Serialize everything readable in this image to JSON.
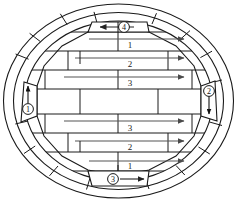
{
  "diagram": {
    "type": "elliptical-kiln-cross-section",
    "shape": "ellipse",
    "wall": {
      "layers": 2,
      "description": "double concentric elliptical ring wall with radial segment joints"
    },
    "canvas": {
      "width": 237,
      "height": 202
    },
    "ports": [
      {
        "id": "port-1",
        "marker": "①",
        "label": "1",
        "position": "left",
        "arrow": "up",
        "arrow_glyph": "↑",
        "x": 28,
        "y": 101
      },
      {
        "id": "port-2",
        "marker": "②",
        "label": "2",
        "position": "right",
        "arrow": "down",
        "arrow_glyph": "↓",
        "x": 209,
        "y": 96
      },
      {
        "id": "port-3",
        "marker": "③",
        "label": "3",
        "position": "bottom",
        "arrow": "right",
        "arrow_glyph": "→",
        "x": 113,
        "y": 182
      },
      {
        "id": "port-4",
        "marker": "④",
        "label": "4",
        "position": "top",
        "arrow": "left",
        "arrow_glyph": "←",
        "x": 124,
        "y": 23
      }
    ],
    "courses": [
      {
        "index": 1,
        "label": "1",
        "y": 46,
        "flow": "right",
        "label_x": 130,
        "arrow_x1": 89,
        "arrow_x2": 186,
        "arrow_y": 39
      },
      {
        "index": 2,
        "label": "2",
        "y": 64,
        "flow": "right",
        "label_x": 130,
        "arrow_x1": 75,
        "arrow_x2": 186,
        "arrow_y": 57
      },
      {
        "index": 3,
        "label": "3",
        "y": 83,
        "flow": "right",
        "label_x": 130,
        "arrow_x1": 64,
        "arrow_x2": 186,
        "arrow_y": 76
      },
      {
        "index": 4,
        "label": "",
        "y": 102,
        "flow": "none",
        "label_x": 130,
        "arrow_x1": 0,
        "arrow_x2": 0,
        "arrow_y": 0
      },
      {
        "index": 5,
        "label": "3",
        "y": 133,
        "flow": "right",
        "label_x": 130,
        "arrow_x1": 64,
        "arrow_x2": 186,
        "arrow_y": 120
      },
      {
        "index": 6,
        "label": "2",
        "y": 153,
        "flow": "right",
        "label_x": 130,
        "arrow_x1": 75,
        "arrow_x2": 186,
        "arrow_y": 142
      },
      {
        "index": 7,
        "label": "1",
        "y": 171,
        "flow": "right",
        "label_x": 130,
        "arrow_x1": 89,
        "arrow_x2": 186,
        "arrow_y": 161
      }
    ],
    "colors": {
      "stroke": "#1a1a1a",
      "arrow": "#555555",
      "background": "#ffffff",
      "text": "#1a1a1a"
    }
  }
}
